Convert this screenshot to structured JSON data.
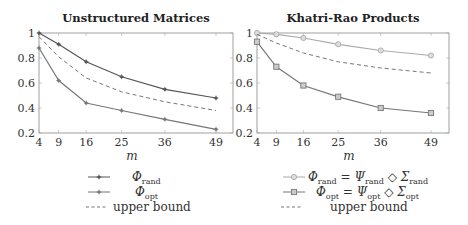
{
  "chart_data": [
    {
      "type": "line",
      "title": "Unstructured Matrices",
      "xlabel": "m",
      "ylabel": "",
      "x": [
        4,
        9,
        16,
        25,
        36,
        49
      ],
      "xticks": [
        "4",
        "9",
        "16",
        "25",
        "36",
        "49"
      ],
      "yticks": [
        "0.2",
        "0.4",
        "0.6",
        "0.8",
        "1"
      ],
      "ylim": [
        0.2,
        1.0
      ],
      "xlim": [
        4,
        53
      ],
      "grid": false,
      "legend_position": "below",
      "series": [
        {
          "name": "Φ_rand",
          "label_main": "Φ",
          "label_sub": "rand",
          "marker": "star",
          "color": "#555555",
          "dash": false,
          "values": [
            1.0,
            0.91,
            0.77,
            0.65,
            0.55,
            0.48
          ]
        },
        {
          "name": "Φ_opt",
          "label_main": "Φ",
          "label_sub": "opt",
          "marker": "star",
          "color": "#777777",
          "dash": false,
          "values": [
            0.88,
            0.62,
            0.44,
            0.38,
            0.31,
            0.23
          ]
        },
        {
          "name": "upper bound",
          "label_main": "upper bound",
          "label_sub": "",
          "marker": "none",
          "color": "#777777",
          "dash": true,
          "values": [
            0.97,
            0.81,
            0.64,
            0.53,
            0.45,
            0.38
          ]
        }
      ]
    },
    {
      "type": "line",
      "title": "Khatri-Rao Products",
      "xlabel": "m",
      "ylabel": "",
      "x": [
        4,
        9,
        16,
        25,
        36,
        49
      ],
      "xticks": [
        "4",
        "9",
        "16",
        "25",
        "36",
        "49"
      ],
      "yticks": [
        "0.2",
        "0.4",
        "0.6",
        "0.8",
        "1"
      ],
      "ylim": [
        0.2,
        1.0
      ],
      "xlim": [
        4,
        53
      ],
      "grid": false,
      "legend_position": "below",
      "series": [
        {
          "name": "Φ_rand = Ψ_rand ◇ Σ_rand",
          "marker": "circle",
          "color": "#aaaaaa",
          "dash": false,
          "values": [
            1.0,
            0.99,
            0.96,
            0.91,
            0.86,
            0.82
          ]
        },
        {
          "name": "Φ_opt = Ψ_opt ◇ Σ_opt",
          "marker": "square",
          "color": "#777777",
          "dash": false,
          "values": [
            0.93,
            0.73,
            0.58,
            0.49,
            0.4,
            0.36
          ]
        },
        {
          "name": "upper bound",
          "marker": "none",
          "color": "#777777",
          "dash": true,
          "values": [
            0.99,
            0.92,
            0.84,
            0.77,
            0.72,
            0.68
          ]
        }
      ]
    }
  ],
  "legend_text": {
    "phi": "Φ",
    "psi": "Ψ",
    "sigma": "Σ",
    "rand": "rand",
    "opt": "opt",
    "equals": "=",
    "diamond": "◇",
    "upper_bound": "upper bound"
  }
}
